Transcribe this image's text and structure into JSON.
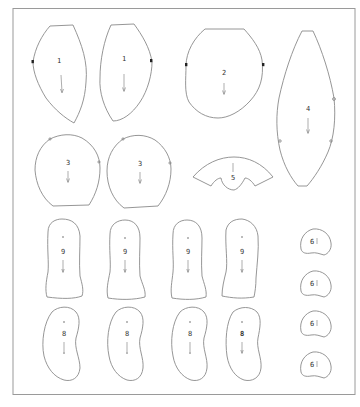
{
  "diagram": {
    "type": "sewing-pattern-layout",
    "colors": {
      "line": "#8a8a8a",
      "frame": "#9a9a9a",
      "label": "#333333",
      "background": "#ffffff"
    },
    "pieces": [
      {
        "id": "p1a",
        "label": "1",
        "shape": "side-panel",
        "grain_arrow": true,
        "notch": "left"
      },
      {
        "id": "p1b",
        "label": "1",
        "shape": "side-panel-mirrored",
        "grain_arrow": true,
        "notch": "right"
      },
      {
        "id": "p2",
        "label": "2",
        "shape": "oval-flat-top",
        "grain_arrow": true,
        "notch": "both-sides"
      },
      {
        "id": "p4",
        "label": "4",
        "shape": "long-gusset",
        "grain_arrow": true
      },
      {
        "id": "p3a",
        "label": "3",
        "shape": "rounded-head",
        "grain_arrow": true
      },
      {
        "id": "p3b",
        "label": "3",
        "shape": "rounded-head",
        "grain_arrow": true
      },
      {
        "id": "p5",
        "label": "5",
        "shape": "arc-fan",
        "grain_arrow": true
      },
      {
        "id": "p9a",
        "label": "9",
        "shape": "boot",
        "grain_arrow": true
      },
      {
        "id": "p9b",
        "label": "9",
        "shape": "boot",
        "grain_arrow": true
      },
      {
        "id": "p9c",
        "label": "9",
        "shape": "boot",
        "grain_arrow": true
      },
      {
        "id": "p9d",
        "label": "9",
        "shape": "boot",
        "grain_arrow": true
      },
      {
        "id": "p8a",
        "label": "8",
        "shape": "bean",
        "grain_arrow": true
      },
      {
        "id": "p8b",
        "label": "8",
        "shape": "bean",
        "grain_arrow": true
      },
      {
        "id": "p8c",
        "label": "8",
        "shape": "bean",
        "grain_arrow": true
      },
      {
        "id": "p8d",
        "label": "8",
        "shape": "bean",
        "grain_arrow": true
      },
      {
        "id": "p6a",
        "label": "6",
        "shape": "small-round",
        "grain_arrow": true
      },
      {
        "id": "p6b",
        "label": "6",
        "shape": "small-round",
        "grain_arrow": true
      },
      {
        "id": "p6c",
        "label": "6",
        "shape": "small-round",
        "grain_arrow": true
      },
      {
        "id": "p6d",
        "label": "6",
        "shape": "small-round",
        "grain_arrow": true
      }
    ]
  }
}
